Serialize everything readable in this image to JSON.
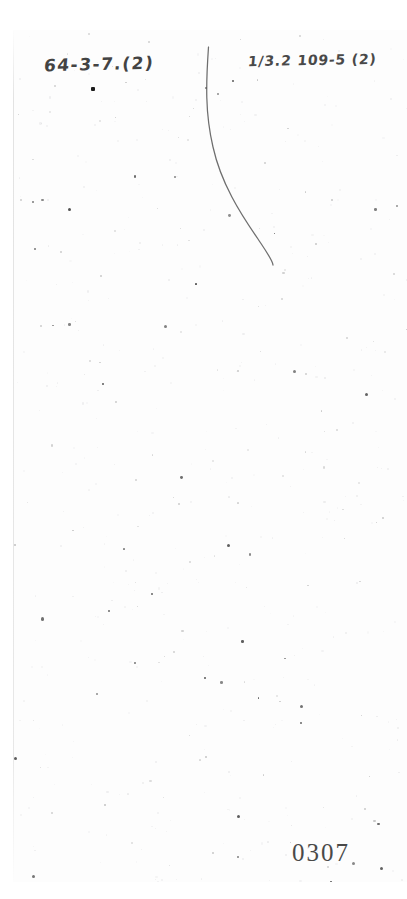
{
  "document": {
    "type": "scanned-page",
    "page_number": "0307",
    "background_color": "#ffffff",
    "sheet_color": "#fdfdfd",
    "ink_color": "#2a2a2a"
  },
  "annotations": {
    "top_left": {
      "text": "64-3-7.(2)",
      "name": "handwritten-reference-left"
    },
    "top_right": {
      "text": "1/3.2  109-5 (2)",
      "name": "handwritten-reference-right"
    },
    "ink_blot": {
      "name": "ink-blot-mark"
    },
    "pen_stroke": {
      "name": "curved-pen-stroke",
      "description": "long vertical S-curve"
    }
  },
  "footer": {
    "page_number": "0307"
  },
  "noise": {
    "speckle_count": 520,
    "seed": 20240307
  }
}
